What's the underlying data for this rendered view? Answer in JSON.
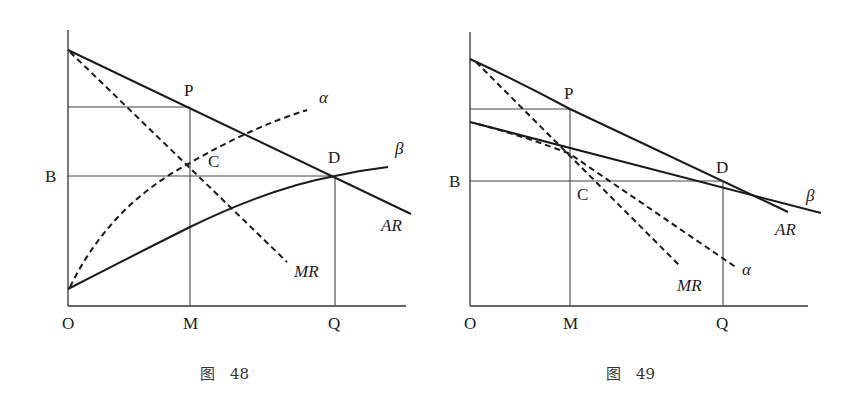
{
  "figures": [
    {
      "caption": "图　48",
      "labels": {
        "origin": "O",
        "m": "M",
        "q": "Q",
        "b": "B",
        "p": "P",
        "c": "C",
        "d": "D",
        "alpha": "α",
        "beta": "β",
        "ar": "AR",
        "mr": "MR"
      },
      "curves": [
        {
          "name": "AR",
          "style": "solid",
          "description": "straight demand line from y-axis through P and D"
        },
        {
          "name": "MR",
          "style": "dashed",
          "description": "marginal revenue, steeper, through C"
        },
        {
          "name": "α",
          "style": "dashed",
          "description": "concave upward-rising curve from near origin through C"
        },
        {
          "name": "β",
          "style": "solid",
          "description": "concave upward-rising curve from near origin through D"
        }
      ]
    },
    {
      "caption": "图　49",
      "labels": {
        "origin": "O",
        "m": "M",
        "q": "Q",
        "b": "B",
        "p": "P",
        "c": "C",
        "d": "D",
        "alpha": "α",
        "beta": "β",
        "ar": "AR",
        "mr": "MR"
      },
      "curves": [
        {
          "name": "AR",
          "style": "solid",
          "description": "downward line through P and D"
        },
        {
          "name": "MR",
          "style": "dashed",
          "description": "steeper downward dashed line"
        },
        {
          "name": "β",
          "style": "solid",
          "description": "flatter downward line through D"
        },
        {
          "name": "α",
          "style": "dashed",
          "description": "dashed line below β, through C"
        }
      ]
    }
  ]
}
